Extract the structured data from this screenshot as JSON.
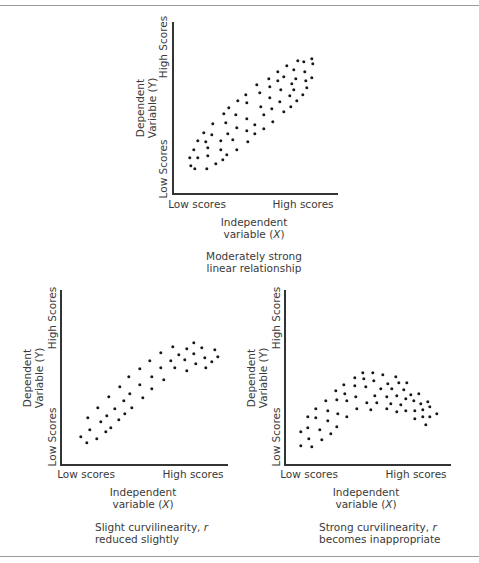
{
  "colors": {
    "axis": "#333333",
    "dot": "#1a1a1a",
    "text": "#3a3a3a",
    "rule": "#9a9a9a"
  },
  "chart_data": [
    {
      "type": "scatter",
      "title": "Moderately strong linear relationship",
      "xlabel": "Independent variable (X)",
      "ylabel": "Dependent Variable (Y)",
      "x_ticks": [
        "Low scores",
        "High scores"
      ],
      "y_ticks": [
        "Low Scores",
        "High Scores"
      ],
      "caption_line1": "Moderately strong",
      "caption_line2": "linear relationship",
      "points": [
        [
          312,
          59
        ],
        [
          304,
          62
        ],
        [
          298,
          61
        ],
        [
          313,
          64
        ],
        [
          287,
          66
        ],
        [
          294,
          70
        ],
        [
          305,
          72
        ],
        [
          278,
          72
        ],
        [
          284,
          77
        ],
        [
          296,
          79
        ],
        [
          312,
          78
        ],
        [
          269,
          79
        ],
        [
          278,
          81
        ],
        [
          257,
          85
        ],
        [
          306,
          81
        ],
        [
          292,
          84
        ],
        [
          270,
          87
        ],
        [
          281,
          90
        ],
        [
          260,
          93
        ],
        [
          294,
          90
        ],
        [
          307,
          88
        ],
        [
          246,
          95
        ],
        [
          303,
          95
        ],
        [
          290,
          96
        ],
        [
          270,
          98
        ],
        [
          238,
          101
        ],
        [
          247,
          103
        ],
        [
          280,
          102
        ],
        [
          297,
          101
        ],
        [
          229,
          108
        ],
        [
          261,
          107
        ],
        [
          272,
          109
        ],
        [
          291,
          107
        ],
        [
          284,
          112
        ],
        [
          224,
          114
        ],
        [
          236,
          115
        ],
        [
          264,
          115
        ],
        [
          213,
          124
        ],
        [
          226,
          123
        ],
        [
          247,
          119
        ],
        [
          273,
          122
        ],
        [
          255,
          125
        ],
        [
          204,
          133
        ],
        [
          212,
          135
        ],
        [
          237,
          128
        ],
        [
          228,
          134
        ],
        [
          247,
          131
        ],
        [
          264,
          129
        ],
        [
          255,
          134
        ],
        [
          198,
          141
        ],
        [
          206,
          142
        ],
        [
          221,
          141
        ],
        [
          233,
          140
        ],
        [
          248,
          142
        ],
        [
          194,
          150
        ],
        [
          208,
          148
        ],
        [
          221,
          150
        ],
        [
          237,
          150
        ],
        [
          190,
          158
        ],
        [
          198,
          158
        ],
        [
          208,
          156
        ],
        [
          227,
          155
        ],
        [
          223,
          160
        ],
        [
          191,
          166
        ],
        [
          195,
          169
        ],
        [
          207,
          169
        ],
        [
          216,
          164
        ]
      ]
    },
    {
      "type": "scatter",
      "title": "Slight curvilinearity, r reduced slightly",
      "xlabel": "Independent variable (X)",
      "ylabel": "Dependent Variable (Y)",
      "x_ticks": [
        "Low scores",
        "High scores"
      ],
      "y_ticks": [
        "Low Scores",
        "High Scores"
      ],
      "caption_line1": "Slight curvilinearity, ",
      "caption_r": "r",
      "caption_line2": "reduced slightly",
      "points": [
        [
          194,
          343
        ],
        [
          173,
          347
        ],
        [
          187,
          349
        ],
        [
          202,
          348
        ],
        [
          215,
          350
        ],
        [
          161,
          353
        ],
        [
          179,
          355
        ],
        [
          194,
          354
        ],
        [
          218,
          357
        ],
        [
          205,
          358
        ],
        [
          150,
          361
        ],
        [
          171,
          361
        ],
        [
          185,
          360
        ],
        [
          196,
          364
        ],
        [
          212,
          362
        ],
        [
          140,
          369
        ],
        [
          161,
          368
        ],
        [
          175,
          368
        ],
        [
          187,
          371
        ],
        [
          206,
          368
        ],
        [
          129,
          377
        ],
        [
          152,
          377
        ],
        [
          164,
          380
        ],
        [
          120,
          387
        ],
        [
          140,
          385
        ],
        [
          152,
          389
        ],
        [
          109,
          397
        ],
        [
          130,
          394
        ],
        [
          143,
          398
        ],
        [
          124,
          401
        ],
        [
          98,
          408
        ],
        [
          115,
          409
        ],
        [
          132,
          408
        ],
        [
          88,
          418
        ],
        [
          107,
          416
        ],
        [
          125,
          414
        ],
        [
          119,
          420
        ],
        [
          101,
          422
        ],
        [
          111,
          428
        ],
        [
          90,
          430
        ],
        [
          106,
          432
        ],
        [
          81,
          437
        ],
        [
          97,
          439
        ],
        [
          87,
          443
        ]
      ]
    },
    {
      "type": "scatter",
      "title": "Strong curvilinearity, r becomes inappropriate",
      "xlabel": "Independent variable (X)",
      "ylabel": "Dependent Variable (Y)",
      "x_ticks": [
        "Low scores",
        "High scores"
      ],
      "y_ticks": [
        "Low Scores",
        "High Scores"
      ],
      "caption_line1": "Strong curvilinearity, ",
      "caption_r": "r",
      "caption_line2": "becomes inappropriate",
      "points": [
        [
          363,
          373
        ],
        [
          373,
          373
        ],
        [
          383,
          375
        ],
        [
          355,
          378
        ],
        [
          364,
          379
        ],
        [
          396,
          377
        ],
        [
          374,
          381
        ],
        [
          344,
          385
        ],
        [
          355,
          386
        ],
        [
          366,
          387
        ],
        [
          388,
          384
        ],
        [
          399,
          383
        ],
        [
          407,
          383
        ],
        [
          381,
          389
        ],
        [
          392,
          389
        ],
        [
          404,
          390
        ],
        [
          336,
          391
        ],
        [
          345,
          394
        ],
        [
          375,
          396
        ],
        [
          387,
          397
        ],
        [
          397,
          396
        ],
        [
          411,
          395
        ],
        [
          419,
          394
        ],
        [
          356,
          397
        ],
        [
          406,
          399
        ],
        [
          326,
          401
        ],
        [
          337,
          400
        ],
        [
          347,
          401
        ],
        [
          367,
          403
        ],
        [
          377,
          403
        ],
        [
          391,
          404
        ],
        [
          401,
          405
        ],
        [
          414,
          401
        ],
        [
          428,
          402
        ],
        [
          421,
          404
        ],
        [
          316,
          409
        ],
        [
          430,
          407
        ],
        [
          423,
          410
        ],
        [
          387,
          409
        ],
        [
          357,
          409
        ],
        [
          371,
          410
        ],
        [
          397,
          412
        ],
        [
          406,
          411
        ],
        [
          415,
          411
        ],
        [
          328,
          411
        ],
        [
          338,
          414
        ],
        [
          437,
          414
        ],
        [
          308,
          417
        ],
        [
          316,
          418
        ],
        [
          347,
          417
        ],
        [
          423,
          417
        ],
        [
          430,
          417
        ],
        [
          415,
          419
        ],
        [
          328,
          421
        ],
        [
          426,
          425
        ],
        [
          337,
          427
        ],
        [
          308,
          428
        ],
        [
          301,
          432
        ],
        [
          320,
          430
        ],
        [
          331,
          434
        ],
        [
          309,
          439
        ],
        [
          322,
          440
        ],
        [
          301,
          446
        ],
        [
          312,
          447
        ]
      ]
    }
  ],
  "labels": {
    "dependent": "Dependent",
    "variable_y": "Variable (Y)",
    "high_scores_y": "High Scores",
    "low_scores_y": "Low Scores",
    "low_scores_x": "Low scores",
    "high_scores_x": "High scores",
    "independent": "Independent",
    "variable_x_prefix": "variable (",
    "variable_x_sym": "X",
    "variable_x_suffix": ")"
  }
}
